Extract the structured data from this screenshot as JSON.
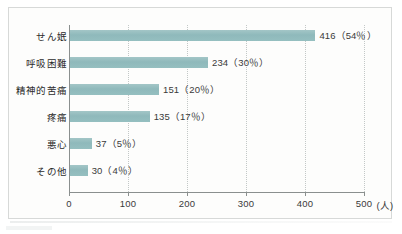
{
  "chart_data": {
    "type": "bar",
    "orientation": "horizontal",
    "title": "",
    "xlabel": "(人)",
    "ylabel": "",
    "xlim": [
      0,
      500
    ],
    "xticks": [
      0,
      100,
      200,
      300,
      400,
      500
    ],
    "xtick_labels": [
      "0",
      "100",
      "200",
      "300",
      "400",
      "500"
    ],
    "unit_label": "(人)",
    "grid": true,
    "grid_style": "dotted-vertical",
    "legend": false,
    "bar_color": "#93bcbe",
    "categories": [
      "せん姄",
      "呼吸困難",
      "精神的苦痛",
      "疼痛",
      "悪心",
      "その他"
    ],
    "values": [
      416,
      234,
      151,
      135,
      37,
      30
    ],
    "percents": [
      "54%",
      "30%",
      "20%",
      "17%",
      "5%",
      "4%"
    ],
    "data_labels": [
      "416（54％）",
      "234（30％）",
      "151（20％）",
      "135（17％）",
      "37（5％）",
      "30（4％）"
    ]
  }
}
